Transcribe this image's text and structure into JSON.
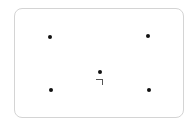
{
  "card": {
    "dots": [
      {
        "id": "top-left",
        "x": 50,
        "y": 37
      },
      {
        "id": "top-right",
        "x": 148,
        "y": 36
      },
      {
        "id": "center",
        "x": 100,
        "y": 72
      },
      {
        "id": "bottom-left",
        "x": 51,
        "y": 90
      },
      {
        "id": "bottom-right",
        "x": 149,
        "y": 90
      }
    ],
    "colors": {
      "dot": "#111111",
      "border": "#d4d4d4",
      "background": "#ffffff"
    }
  }
}
